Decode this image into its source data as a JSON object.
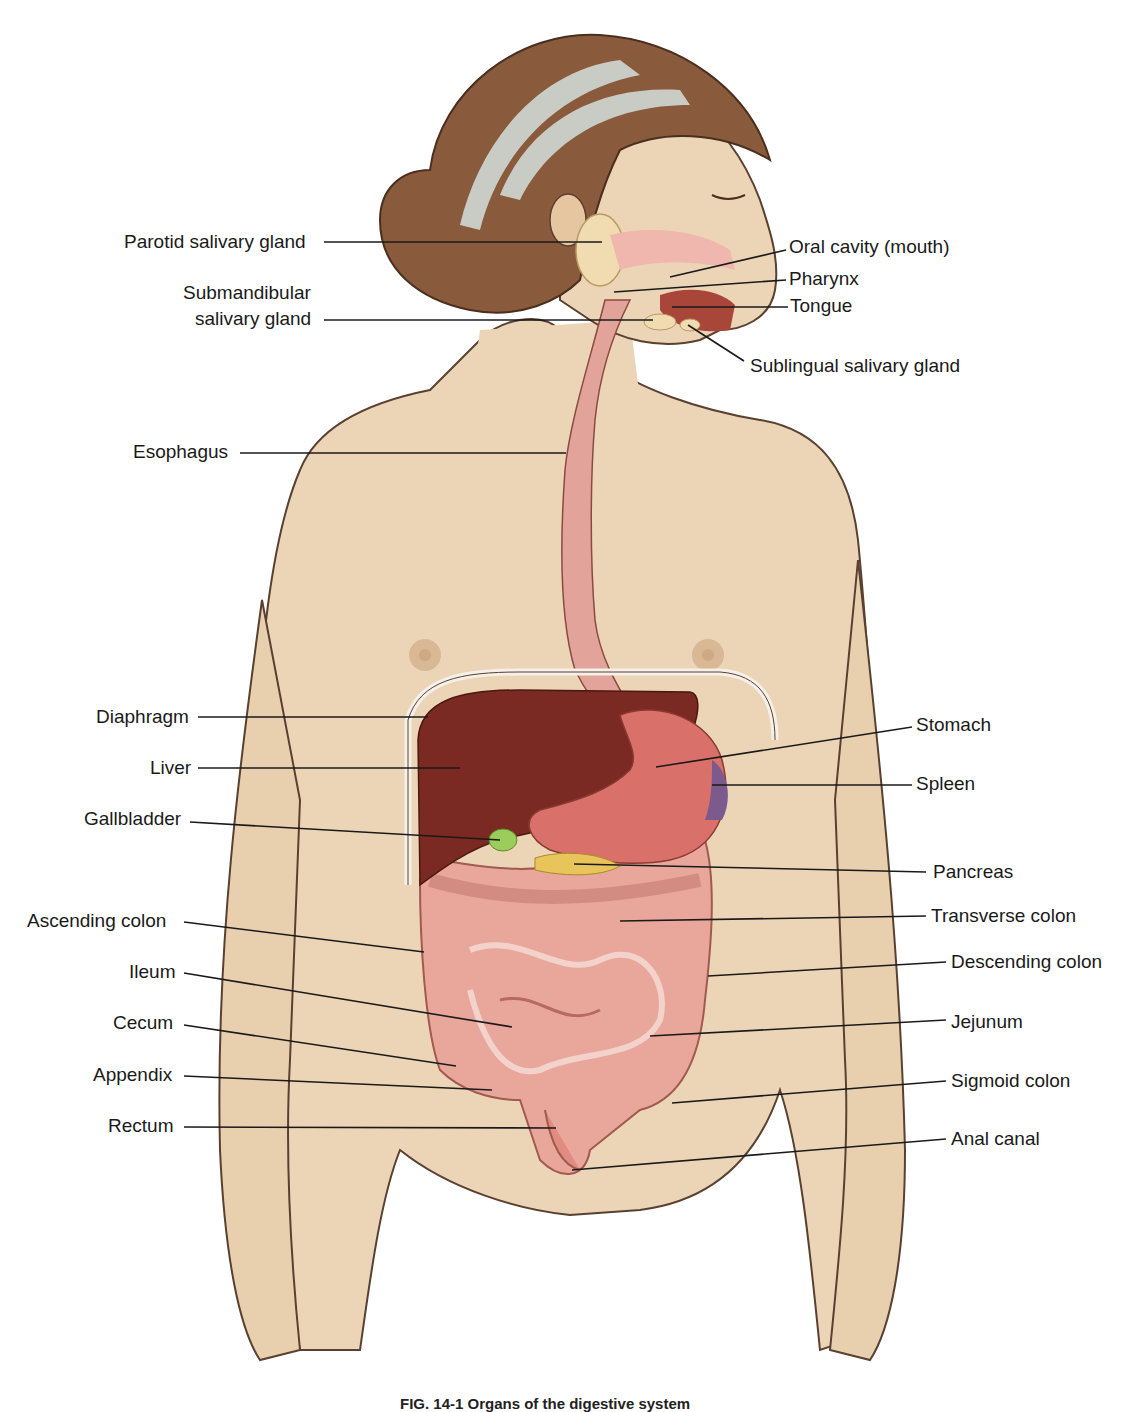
{
  "figure": {
    "type": "anatomical-illustration",
    "caption_visible_fragment": "FIG. 14-1 Organs of the digestive system",
    "colors": {
      "skin": "#ecd5b6",
      "skin_outline": "#5a4030",
      "hair": "#8a5a3c",
      "headband": "#c9ccc4",
      "esophagus": "#e2a49a",
      "liver": "#7a2a22",
      "stomach": "#d9716a",
      "spleen": "#7c5a8c",
      "gallbladder": "#9ccc5a",
      "pancreas": "#e8c45a",
      "intestine": "#e9a79c",
      "salivary_gland": "#f0dcb0",
      "leader_line": "#1a1a1a"
    }
  },
  "labels_left": [
    {
      "id": "parotid",
      "text": "Parotid salivary gland",
      "x": 124,
      "y": 231,
      "line": [
        324,
        242,
        602,
        242
      ]
    },
    {
      "id": "submandibular_1",
      "text": "Submandibular",
      "x": 183,
      "y": 282,
      "line": null
    },
    {
      "id": "submandibular_2",
      "text": "salivary gland",
      "x": 195,
      "y": 308,
      "line": [
        324,
        320,
        653,
        320
      ]
    },
    {
      "id": "esophagus",
      "text": "Esophagus",
      "x": 133,
      "y": 441,
      "line": [
        240,
        453,
        566,
        453
      ]
    },
    {
      "id": "diaphragm",
      "text": "Diaphragm",
      "x": 96,
      "y": 706,
      "line": [
        198,
        717,
        428,
        717
      ]
    },
    {
      "id": "liver",
      "text": "Liver",
      "x": 150,
      "y": 757,
      "line": [
        198,
        768,
        460,
        768
      ]
    },
    {
      "id": "gallbladder",
      "text": "Gallbladder",
      "x": 84,
      "y": 808,
      "line": [
        190,
        822,
        500,
        840
      ]
    },
    {
      "id": "ascending_colon",
      "text": "Ascending colon",
      "x": 27,
      "y": 910,
      "line": [
        184,
        922,
        424,
        952
      ]
    },
    {
      "id": "ileum",
      "text": "Ileum",
      "x": 129,
      "y": 961,
      "line": [
        184,
        973,
        512,
        1027
      ]
    },
    {
      "id": "cecum",
      "text": "Cecum",
      "x": 113,
      "y": 1012,
      "line": [
        184,
        1025,
        456,
        1066
      ]
    },
    {
      "id": "appendix",
      "text": "Appendix",
      "x": 93,
      "y": 1064,
      "line": [
        184,
        1076,
        492,
        1090
      ]
    },
    {
      "id": "rectum",
      "text": "Rectum",
      "x": 108,
      "y": 1115,
      "line": [
        184,
        1127,
        556,
        1128
      ]
    }
  ],
  "labels_right": [
    {
      "id": "oral_cavity",
      "text": "Oral cavity (mouth)",
      "x": 789,
      "y": 236,
      "line": [
        786,
        250,
        670,
        277
      ]
    },
    {
      "id": "pharynx",
      "text": "Pharynx",
      "x": 789,
      "y": 268,
      "line": [
        786,
        280,
        614,
        292
      ]
    },
    {
      "id": "tongue",
      "text": "Tongue",
      "x": 790,
      "y": 295,
      "line": [
        788,
        307,
        672,
        307
      ]
    },
    {
      "id": "sublingual",
      "text": "Sublingual salivary gland",
      "x": 750,
      "y": 355,
      "line": [
        744,
        361,
        688,
        325
      ]
    },
    {
      "id": "stomach",
      "text": "Stomach",
      "x": 916,
      "y": 714,
      "line": [
        912,
        727,
        656,
        767
      ]
    },
    {
      "id": "spleen",
      "text": "Spleen",
      "x": 916,
      "y": 773,
      "line": [
        912,
        785,
        712,
        785
      ]
    },
    {
      "id": "pancreas",
      "text": "Pancreas",
      "x": 933,
      "y": 861,
      "line": [
        926,
        872,
        574,
        864
      ]
    },
    {
      "id": "transverse_colon",
      "text": "Transverse colon",
      "x": 931,
      "y": 905,
      "line": [
        926,
        916,
        620,
        921
      ]
    },
    {
      "id": "descending_colon",
      "text": "Descending colon",
      "x": 951,
      "y": 951,
      "line": [
        946,
        962,
        708,
        976
      ]
    },
    {
      "id": "jejunum",
      "text": "Jejunum",
      "x": 951,
      "y": 1011,
      "line": [
        946,
        1020,
        650,
        1036
      ]
    },
    {
      "id": "sigmoid_colon",
      "text": "Sigmoid colon",
      "x": 951,
      "y": 1070,
      "line": [
        946,
        1081,
        672,
        1103
      ]
    },
    {
      "id": "anal_canal",
      "text": "Anal canal",
      "x": 951,
      "y": 1128,
      "line": [
        946,
        1139,
        572,
        1170
      ]
    }
  ]
}
